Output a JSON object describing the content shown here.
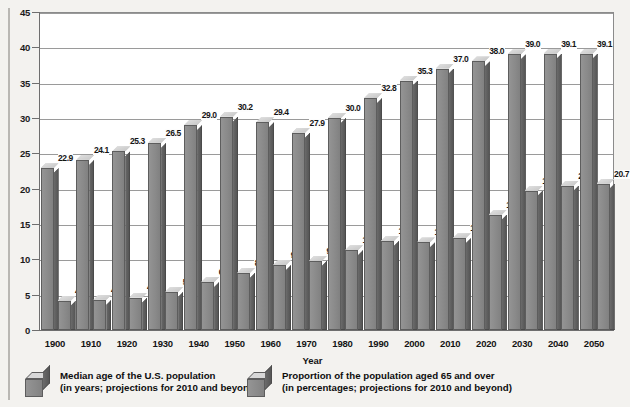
{
  "chart_data": {
    "type": "bar",
    "title": "",
    "xlabel": "Year",
    "ylabel": "",
    "ylim": [
      0,
      45
    ],
    "ystep": 5,
    "grid": true,
    "legend_position": "bottom",
    "categories": [
      "1900",
      "1910",
      "1920",
      "1930",
      "1940",
      "1950",
      "1960",
      "1970",
      "1980",
      "1990",
      "2000",
      "2010",
      "2020",
      "2030",
      "2040",
      "2050"
    ],
    "ytick_labels": [
      "0",
      "5",
      "10",
      "15",
      "20",
      "25",
      "30",
      "35",
      "40",
      "45"
    ],
    "series": [
      {
        "name": "Median age of the U.S. population",
        "name_line2": "(in years; projections for 2010 and beyond)",
        "values": [
          22.9,
          24.1,
          25.3,
          26.5,
          29.0,
          30.2,
          29.4,
          27.9,
          30.0,
          32.8,
          35.3,
          37.0,
          38.0,
          39.0,
          39.1,
          39.1
        ],
        "labels": [
          "22.9",
          "24.1",
          "25.3",
          "26.5",
          "29.0",
          "30.2",
          "29.4",
          "27.9",
          "30.0",
          "32.8",
          "35.3",
          "37.0",
          "38.0",
          "39.0",
          "39.1",
          "39.1"
        ]
      },
      {
        "name": "Proportion of the population aged 65 and over",
        "name_line2": "(in percentages; projections for 2010 and beyond)",
        "values": [
          4.1,
          4.3,
          4.6,
          5.4,
          6.8,
          8.1,
          9.2,
          9.8,
          11.3,
          12.6,
          12.4,
          13.0,
          16.3,
          19.7,
          20.4,
          20.7
        ],
        "labels": [
          "4.1",
          "4.3",
          "4.6",
          "5.4",
          "6.8",
          "8.1",
          "9.2",
          "9.8",
          "11.3",
          "12.6",
          "12.4",
          "13.0",
          "16.3",
          "19.7",
          "20.4",
          "20.7"
        ]
      }
    ],
    "colors": {
      "bar_front": "#8b8b8b",
      "bar_top": "#d6d6d6",
      "bar_side": "#5f5f5f",
      "grid": "#9a9a9a",
      "axis": "#6e6e6e",
      "plot_background": "#ffffff",
      "page_background": "#f3f2ef",
      "text": "#141414"
    }
  },
  "axis_title": "Year",
  "legend": [
    {
      "line1": "Median age of the U.S. population",
      "line2": "(in years; projections for 2010 and beyond)"
    },
    {
      "line1": "Proportion of the population aged 65 and over",
      "line2": "(in percentages; projections for 2010 and beyond)"
    }
  ]
}
